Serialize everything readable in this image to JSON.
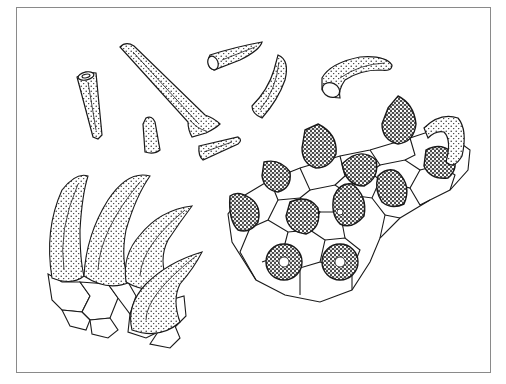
{
  "figure": {
    "type": "scientific illustration",
    "style": "pen-and-ink stipple drawing",
    "colors": {
      "ink": "#1a1a1a",
      "frame": "#8a8a8a",
      "background": "#ffffff"
    },
    "panels": [
      {
        "id": "isolated-hairs",
        "description": "seven detached conical hair fragments, some hollow at base"
      },
      {
        "id": "hair-cluster",
        "description": "four curved stippled hairs rising from polygonal basal cells"
      },
      {
        "id": "epidermis",
        "description": "polygonal epidermal cell network with twelve dark glandular hair bases and one curved hair"
      }
    ]
  }
}
